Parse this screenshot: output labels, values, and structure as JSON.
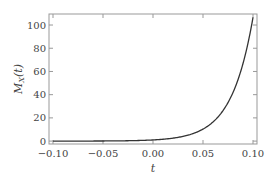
{
  "chart_data": {
    "type": "line",
    "title": "",
    "xlabel": "t",
    "ylabel": "M_X(t)",
    "xlim": [
      -0.104,
      0.104
    ],
    "ylim": [
      -2.5,
      109.5
    ],
    "xticks": [
      -0.1,
      -0.05,
      0.0,
      0.05,
      0.1
    ],
    "xtick_labels": [
      "−0.10",
      "−0.05",
      "0.00",
      "0.05",
      "0.10"
    ],
    "yticks": [
      0,
      20,
      40,
      60,
      80,
      100
    ],
    "ytick_labels": [
      "0",
      "20",
      "40",
      "60",
      "80",
      "100"
    ],
    "grid": false,
    "legend": null,
    "series": [
      {
        "name": "M_X(t)",
        "color": "#333333",
        "x": [
          -0.1,
          -0.08,
          -0.06,
          -0.04,
          -0.02,
          0.0,
          0.01,
          0.02,
          0.03,
          0.04,
          0.05,
          0.06,
          0.07,
          0.08,
          0.09,
          0.1
        ],
        "y": [
          0.01,
          0.02,
          0.06,
          0.15,
          0.39,
          1.0,
          1.6,
          2.5,
          4.1,
          6.5,
          10.3,
          16.5,
          26.3,
          42.0,
          66.8,
          106.6
        ]
      }
    ]
  }
}
